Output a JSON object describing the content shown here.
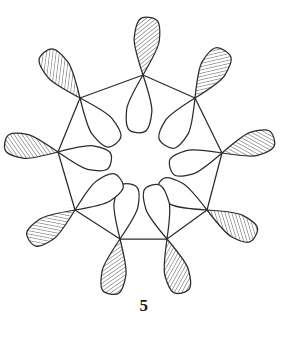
{
  "figure": {
    "label": "5",
    "background_color": "#ffffff",
    "stroke_color": "#2b2b2b",
    "hatch_color": "#3a3a3a",
    "lobe_fill": "#ffffff",
    "stroke_width": 1.25,
    "hatch_spacing": 3.2,
    "hatch_angle_deg": -45,
    "width": 288,
    "height": 342
  },
  "chart_data": {
    "type": "diagram",
    "ring_type": "nonagon",
    "vertex_count": 9,
    "ring_center": [
      141,
      154
    ],
    "ring_radius": 80,
    "lobe_length": 56,
    "lobe_width": 22,
    "legend": [
      {
        "name": "shaded-lobe",
        "description": "hatched phase lobe"
      },
      {
        "name": "open-lobe",
        "description": "unshaded phase lobe"
      }
    ],
    "nodes": [
      {
        "index": 0,
        "name": "orbital-node-1",
        "x": 143,
        "y": 75,
        "orbital_angle_deg": -84,
        "shaded_side": "outer",
        "lobe_length": 58,
        "lobe_width": 23
      },
      {
        "index": 1,
        "name": "orbital-node-2",
        "x": 195,
        "y": 98,
        "orbital_angle_deg": -58,
        "shaded_side": "outer",
        "lobe_length": 56,
        "lobe_width": 24
      },
      {
        "index": 2,
        "name": "orbital-node-3",
        "x": 222,
        "y": 153,
        "orbital_angle_deg": -16,
        "shaded_side": "outer",
        "lobe_length": 54,
        "lobe_width": 22
      },
      {
        "index": 3,
        "name": "orbital-node-4",
        "x": 207,
        "y": 210,
        "orbital_angle_deg": 28,
        "shaded_side": "outer",
        "lobe_length": 55,
        "lobe_width": 22
      },
      {
        "index": 4,
        "name": "orbital-node-5",
        "x": 167,
        "y": 239,
        "orbital_angle_deg": 74,
        "shaded_side": "outer",
        "lobe_length": 56,
        "lobe_width": 22
      },
      {
        "index": 5,
        "name": "orbital-node-6",
        "x": 120,
        "y": 239,
        "orbital_angle_deg": 100,
        "shaded_side": "outer",
        "lobe_length": 56,
        "lobe_width": 22
      },
      {
        "index": 6,
        "name": "orbital-node-7",
        "x": 75,
        "y": 210,
        "orbital_angle_deg": 146,
        "shaded_side": "outer",
        "lobe_length": 55,
        "lobe_width": 22
      },
      {
        "index": 7,
        "name": "orbital-node-8",
        "x": 58,
        "y": 152,
        "orbital_angle_deg": 190,
        "shaded_side": "outer",
        "lobe_length": 54,
        "lobe_width": 22
      },
      {
        "index": 8,
        "name": "orbital-node-9",
        "x": 80,
        "y": 98,
        "orbital_angle_deg": 232,
        "shaded_side": "outer",
        "lobe_length": 58,
        "lobe_width": 23
      }
    ],
    "bonds": [
      {
        "from": 0,
        "to": 1
      },
      {
        "from": 1,
        "to": 2
      },
      {
        "from": 2,
        "to": 3
      },
      {
        "from": 3,
        "to": 4
      },
      {
        "from": 4,
        "to": 5
      },
      {
        "from": 5,
        "to": 6
      },
      {
        "from": 6,
        "to": 7
      },
      {
        "from": 7,
        "to": 8
      },
      {
        "from": 8,
        "to": 0
      }
    ]
  }
}
